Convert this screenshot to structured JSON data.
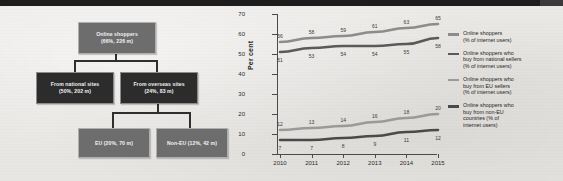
{
  "diagram": {
    "nodes": [
      {
        "id": "root",
        "line1": "Online shoppers",
        "line2": "(66%, 226 m)"
      },
      {
        "id": "national",
        "line1": "From national sites",
        "line2": "(50%, 202 m)"
      },
      {
        "id": "overseas",
        "line1": "From overseas sites",
        "line2": "(24%, 83 m)"
      },
      {
        "id": "eu",
        "line1": "EU (20%, 70 m)",
        "line2": ""
      },
      {
        "id": "noneu",
        "line1": "Non-EU (12%, 42 m)",
        "line2": ""
      }
    ]
  },
  "chart_data": {
    "type": "line",
    "title": "",
    "xlabel": "",
    "ylabel": "Per cent",
    "categories": [
      "2010",
      "2011",
      "2012",
      "2013",
      "2014",
      "2015"
    ],
    "ylim": [
      0,
      70
    ],
    "yticks": [
      0,
      10,
      20,
      30,
      40,
      50,
      60,
      70
    ],
    "grid": false,
    "legend_position": "right",
    "series": [
      {
        "name": "Online shoppers (% of internet users)",
        "color": "#8c8c8c",
        "values": [
          56,
          58,
          59,
          61,
          63,
          65
        ],
        "label_side": "above"
      },
      {
        "name": "Online shoppers who buy from national sellers (% of internet users)",
        "color": "#5a5a5a",
        "values": [
          51,
          53,
          54,
          54,
          55,
          58
        ],
        "label_side": "below"
      },
      {
        "name": "Online shoppers who buy from EU sellers (% of internet users)",
        "color": "#9a9a9a",
        "values": [
          12,
          13,
          14,
          16,
          18,
          20
        ],
        "label_side": "above"
      },
      {
        "name": "Online shoppers who buy from non-EU countries (% of internet users)",
        "color": "#4a4a4a",
        "values": [
          7,
          7,
          8,
          9,
          11,
          12
        ],
        "label_side": "below"
      }
    ]
  },
  "legend": {
    "items": [
      {
        "color": "#8c8c8c",
        "lines": [
          "Online shoppers",
          "(% of internet users)"
        ]
      },
      {
        "color": "#5a5a5a",
        "lines": [
          "Online shoppers who",
          "buy from national sellers",
          "(% of internet users)"
        ]
      },
      {
        "color": "#9a9a9a",
        "lines": [
          "Online shoppers who",
          "buy from EU sellers",
          "(% of internet users)"
        ]
      },
      {
        "color": "#4a4a4a",
        "lines": [
          "Online shoppers who",
          "buy from non-EU",
          "countries (% of",
          "internet users)"
        ]
      }
    ]
  }
}
